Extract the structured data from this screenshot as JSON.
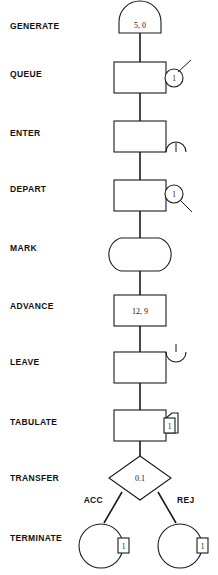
{
  "diagram": {
    "line_color": "#1a1a1a",
    "background": "#ffffff",
    "rows": [
      {
        "label": "GENERATE",
        "symbol": "dome-generate",
        "value": "5, 0",
        "attachment": "none",
        "attachment_value": ""
      },
      {
        "label": "QUEUE",
        "symbol": "rectangle",
        "value": "",
        "attachment": "circle-with-upright-line",
        "attachment_value": "1"
      },
      {
        "label": "ENTER",
        "symbol": "rectangle",
        "value": "",
        "attachment": "dome-down-with-tick",
        "attachment_value": "1"
      },
      {
        "label": "DEPART",
        "symbol": "rectangle",
        "value": "",
        "attachment": "circle-with-downright-line",
        "attachment_value": "1"
      },
      {
        "label": "MARK",
        "symbol": "barrel",
        "value": "",
        "attachment": "none",
        "attachment_value": ""
      },
      {
        "label": "ADVANCE",
        "symbol": "rectangle",
        "value": "12, 9",
        "attachment": "none",
        "attachment_value": ""
      },
      {
        "label": "LEAVE",
        "symbol": "rectangle",
        "value": "",
        "attachment": "dome-up-with-tick",
        "attachment_value": "1"
      },
      {
        "label": "TABULATE",
        "symbol": "rectangle",
        "value": "",
        "attachment": "tag-rectangle",
        "attachment_value": "1"
      },
      {
        "label": "TRANSFER",
        "symbol": "diamond",
        "value": "0.1",
        "attachment": "none",
        "attachment_value": ""
      },
      {
        "label": "TERMINATE",
        "symbol": "double-circle",
        "value": "",
        "attachment": "tag-rectangle",
        "attachment_value": "1"
      }
    ],
    "branches": {
      "left_label": "ACC",
      "right_label": "REJ"
    },
    "terminate_tags": {
      "left": "1",
      "right": "1"
    }
  }
}
